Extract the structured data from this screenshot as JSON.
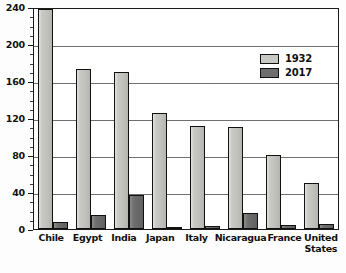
{
  "chart_data": {
    "type": "bar",
    "title": "",
    "subtitle": "",
    "xlabel": "",
    "ylabel": "",
    "ylim": [
      0,
      240
    ],
    "y_major_ticks": [
      0,
      40,
      80,
      120,
      160,
      200,
      240
    ],
    "y_minor_tick_interval": 10,
    "grid": "horizontal",
    "legend_position": "upper-right-inside",
    "categories": [
      "Chile",
      "Egypt",
      "India",
      "Japan",
      "Italy",
      "Nicaragua",
      "France",
      "United States"
    ],
    "series": [
      {
        "name": "1932",
        "color": "#c9c9c4",
        "values": [
          238,
          173,
          170,
          125,
          111,
          110,
          80,
          50
        ]
      },
      {
        "name": "2017",
        "color": "#6e6e6e",
        "values": [
          8,
          15,
          37,
          2,
          3,
          17,
          4,
          5
        ]
      }
    ]
  },
  "axis": {
    "y_tick_labels": [
      "240",
      "200",
      "160",
      "120",
      "80",
      "40",
      "0"
    ]
  },
  "legend": {
    "items": [
      {
        "label": "1932"
      },
      {
        "label": "2017"
      }
    ]
  },
  "xaxis": {
    "labels": [
      {
        "line1": "Chile",
        "line2": ""
      },
      {
        "line1": "Egypt",
        "line2": ""
      },
      {
        "line1": "India",
        "line2": ""
      },
      {
        "line1": "Japan",
        "line2": ""
      },
      {
        "line1": "Italy",
        "line2": ""
      },
      {
        "line1": "Nicaragua",
        "line2": ""
      },
      {
        "line1": "France",
        "line2": ""
      },
      {
        "line1": "United",
        "line2": "States"
      }
    ]
  }
}
